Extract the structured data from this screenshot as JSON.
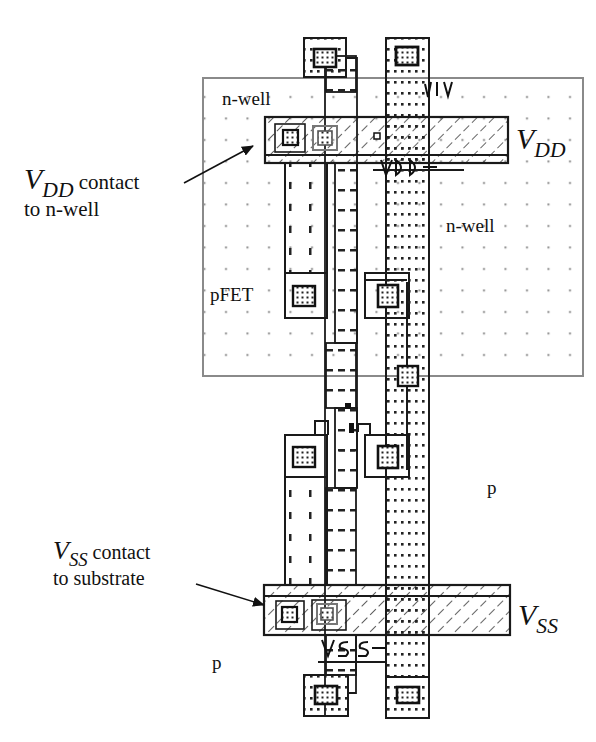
{
  "diagram": {
    "type": "CMOS inverter layout (stick/mask view)",
    "regions": {
      "nwell_label_top": "n-well",
      "nwell_label_right": "n-well",
      "pfet_label": "pFET",
      "substrate_label_right": "p",
      "substrate_label_bottom": "p"
    },
    "rails": {
      "vdd": {
        "main": "V",
        "sub": "DD"
      },
      "vss": {
        "main": "V",
        "sub": "SS"
      }
    },
    "layout_text": {
      "vdd_mask_text": "VDD",
      "vss_mask_text": "VSS"
    },
    "callouts": [
      {
        "id": "vdd-contact",
        "main": "V",
        "sub": "DD",
        "line1_rest": " contact",
        "line2": "to n-well"
      },
      {
        "id": "vss-contact",
        "main": "V",
        "sub": "SS",
        "line1_rest": " contact",
        "line2": "to substrate"
      }
    ],
    "colors": {
      "stroke": "#1a1a1a",
      "nwell_border": "#8a8a8a",
      "grid_dot": "#8c8c8c",
      "background": "#ffffff"
    }
  }
}
